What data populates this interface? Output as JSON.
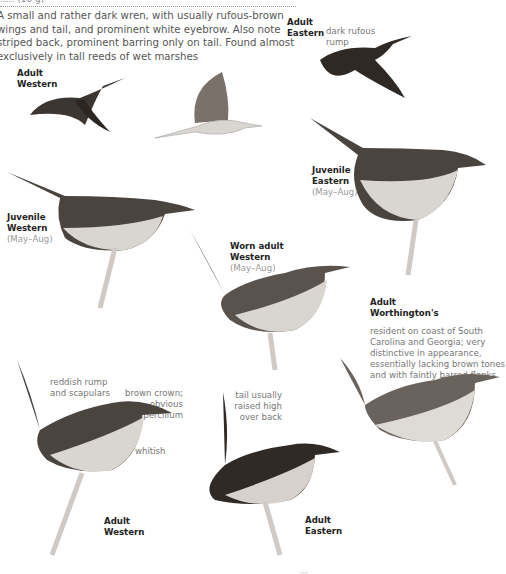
{
  "page": {
    "header_partial": "..... (10 g)",
    "intro": "A small and rather dark wren, with usually rufous-brown wings and tail, and prominent white eyebrow. Also note striped back, prominent barring only on tail. Found almost exclusively in tall reeds of wet marshes",
    "footer_partial": "..."
  },
  "plates": [
    {
      "id": "adult-western-flight",
      "title1": "Adult",
      "title2": "Western",
      "sub": "",
      "notes": []
    },
    {
      "id": "flight-underside",
      "title1": "",
      "title2": "",
      "sub": "",
      "notes": []
    },
    {
      "id": "adult-eastern-flight",
      "title1": "Adult",
      "title2": "Eastern",
      "sub": "",
      "notes": [
        "dark rufous rump"
      ]
    },
    {
      "id": "juvenile-eastern",
      "title1": "Juvenile",
      "title2": "Eastern",
      "sub": "(May–Aug)",
      "notes": []
    },
    {
      "id": "juvenile-western",
      "title1": "Juvenile",
      "title2": "Western",
      "sub": "(May–Aug)",
      "notes": []
    },
    {
      "id": "worn-adult-western",
      "title1": "Worn adult",
      "title2": "Western",
      "sub": "(May–Aug)",
      "notes": []
    },
    {
      "id": "adult-worthingtons",
      "title1": "Adult",
      "title2": "Worthington's",
      "sub": "",
      "notes": [
        "resident on coast of South Carolina and Georgia; very distinctive in appearance, essentially lacking brown tones and with faintly barred flanks"
      ]
    },
    {
      "id": "adult-western-perched",
      "title1": "Adult",
      "title2": "Western",
      "sub": "",
      "notes": [
        "reddish rump and scapulars",
        "brown crown; obvious supercilium",
        "whitish"
      ]
    },
    {
      "id": "adult-eastern-perched",
      "title1": "Adult",
      "title2": "Eastern",
      "sub": "",
      "notes": [
        "tail usually raised high over back"
      ]
    }
  ],
  "colors": {
    "ink": "#222222",
    "note": "#777777",
    "season": "#999999",
    "bird_dark": "#3b3631",
    "bird_mid": "#7a716a",
    "bird_light": "#d9d5d0"
  }
}
